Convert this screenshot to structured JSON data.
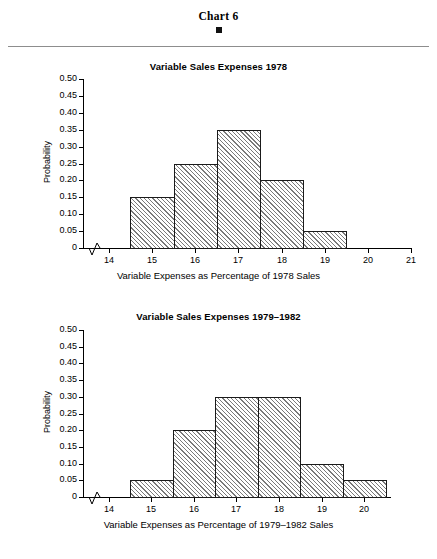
{
  "page": {
    "header_title": "Chart 6",
    "header_marker": "filled-square-bullet"
  },
  "charts": [
    {
      "id": "chart-1978",
      "title": "Variable Sales Expenses 1978",
      "ylabel": "Probability",
      "xlabel": "Variable Expenses as Percentage of 1978 Sales",
      "ytick_labels": [
        "0.50",
        "0.45",
        "0.40",
        "0.35",
        "0.30",
        "0.25",
        "0.20",
        "0.15",
        "0.10",
        "0.05",
        "0"
      ],
      "xtick_labels": [
        "14",
        "15",
        "16",
        "17",
        "18",
        "19",
        "20",
        "21"
      ]
    },
    {
      "id": "chart-1979-1982",
      "title": "Variable Sales Expenses 1979–1982",
      "ylabel": "Probability",
      "xlabel": "Variable Expenses as Percentage of 1979–1982 Sales",
      "ytick_labels": [
        "0.50",
        "0.45",
        "0.40",
        "0.35",
        "0.30",
        "0.25",
        "0.20",
        "0.15",
        "0.10",
        "0.05",
        "0"
      ],
      "xtick_labels": [
        "14",
        "15",
        "16",
        "17",
        "18",
        "19",
        "20"
      ]
    }
  ],
  "chart_data": [
    {
      "type": "bar",
      "title": "Variable Sales Expenses 1978",
      "xlabel": "Variable Expenses as Percentage of 1978 Sales",
      "ylabel": "Probability",
      "xlim": [
        13.4,
        21.0
      ],
      "ylim": [
        0,
        0.5
      ],
      "axis_break_x": true,
      "grid": false,
      "legend": "none",
      "xticks": [
        14,
        15,
        16,
        17,
        18,
        19,
        20,
        21
      ],
      "yticks": [
        0,
        0.05,
        0.1,
        0.15,
        0.2,
        0.25,
        0.3,
        0.35,
        0.4,
        0.45,
        0.5
      ],
      "bin_edges": [
        14.5,
        15.5,
        16.5,
        17.5,
        18.5,
        19.5
      ],
      "categories": [
        "14.5-15.5",
        "15.5-16.5",
        "16.5-17.5",
        "17.5-18.5",
        "18.5-19.5"
      ],
      "values": [
        0.15,
        0.25,
        0.35,
        0.2,
        0.05
      ]
    },
    {
      "type": "bar",
      "title": "Variable Sales Expenses 1979–1982",
      "xlabel": "Variable Expenses as Percentage of 1979–1982 Sales",
      "ylabel": "Probability",
      "xlim": [
        13.4,
        20.6
      ],
      "ylim": [
        0,
        0.5
      ],
      "axis_break_x": true,
      "grid": false,
      "legend": "none",
      "xticks": [
        14,
        15,
        16,
        17,
        18,
        19,
        20
      ],
      "yticks": [
        0,
        0.05,
        0.1,
        0.15,
        0.2,
        0.25,
        0.3,
        0.35,
        0.4,
        0.45,
        0.5
      ],
      "bin_edges": [
        14.5,
        15.5,
        16.5,
        17.5,
        18.5,
        19.5,
        20.5
      ],
      "categories": [
        "14.5-15.5",
        "15.5-16.5",
        "16.5-17.5",
        "17.5-18.5",
        "18.5-19.5",
        "19.5-20.5"
      ],
      "values": [
        0.05,
        0.2,
        0.3,
        0.3,
        0.1,
        0.05
      ]
    }
  ]
}
